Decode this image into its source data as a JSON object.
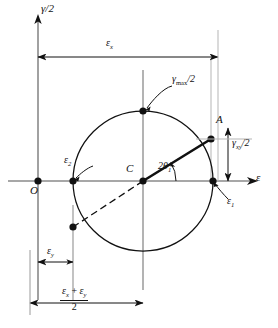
{
  "figure": {
    "type": "mohrs-circle-strain",
    "background": "#ffffff",
    "ink": "#111111",
    "axis_color": "#6b6b6b"
  },
  "axes": {
    "vertical_label": "γ/2",
    "horizontal_label": "ε",
    "origin_label": "O"
  },
  "points": {
    "center_label": "C",
    "point_a_label": "A",
    "top_label": "γ",
    "top_label_sub": "max",
    "top_label_tail": "/2"
  },
  "labels": {
    "eps_1": "ε",
    "eps_1_sub": "1",
    "eps_2": "ε",
    "eps_2_sub": "2",
    "angle": "2θ",
    "angle_sub": "1",
    "gamma_xy_main": "γ",
    "gamma_xy_sub": "xy",
    "gamma_xy_tail": "/2"
  },
  "dimensions": {
    "eps_x": "ε",
    "eps_x_sub": "x",
    "eps_y": "ε",
    "eps_y_sub": "y",
    "avg_numerator_a": "ε",
    "avg_numerator_a_sub": "x",
    "avg_numerator_plus": " + ",
    "avg_numerator_b": "ε",
    "avg_numerator_b_sub": "y",
    "avg_denominator": "2"
  },
  "geometry": {
    "origin": [
      38,
      181
    ],
    "center": [
      143,
      181
    ],
    "radius": 70,
    "point_a": [
      211,
      139
    ],
    "point_b": [
      73,
      227
    ],
    "eps1_x": 213,
    "eps2_x": 73,
    "top_y": 111,
    "angle_deg": 31
  }
}
